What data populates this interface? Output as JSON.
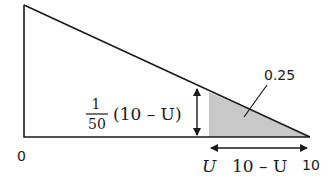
{
  "diagram": {
    "type": "triangle-area-diagram",
    "colors": {
      "stroke": "#1a1a1a",
      "shade": "#c8c8c8",
      "background": "#ffffff"
    },
    "labels": {
      "origin": "0",
      "end": "10",
      "lower_bound": "U",
      "width": "10 – U",
      "area": "0.25",
      "height_numerator": "1",
      "height_denominator": "50",
      "height_factor": "(10 – U)"
    }
  }
}
